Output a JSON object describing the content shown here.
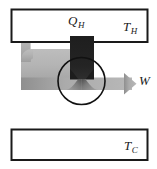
{
  "diagram": {
    "kind": "heat-engine-energy-flow",
    "reservoirs": [
      {
        "id": "hot",
        "label": "T",
        "subscript": "H",
        "role": "hot-reservoir"
      },
      {
        "id": "cold",
        "label": "T",
        "subscript": "C",
        "role": "cold-reservoir"
      }
    ],
    "flows": [
      {
        "id": "qh",
        "label": "Q",
        "subscript": "H",
        "role": "heat-input-from-hot-reservoir",
        "direction": "down"
      },
      {
        "id": "w",
        "label": "W",
        "subscript": "",
        "role": "work-output",
        "direction": "right"
      },
      {
        "id": "return",
        "label": "",
        "subscript": "",
        "role": "return-flow-up-left",
        "direction": "up"
      }
    ],
    "engine": {
      "id": "engine",
      "role": "engine-cycle-circle"
    },
    "colors": {
      "outline": "#1a1a1a",
      "hot_band_fill": "#262626",
      "flow_arrow_fill": "#b0b0b0",
      "flow_arrow_fill_dark": "#8a8a8a",
      "background": "#ffffff",
      "label": "#1a1a1a"
    }
  }
}
